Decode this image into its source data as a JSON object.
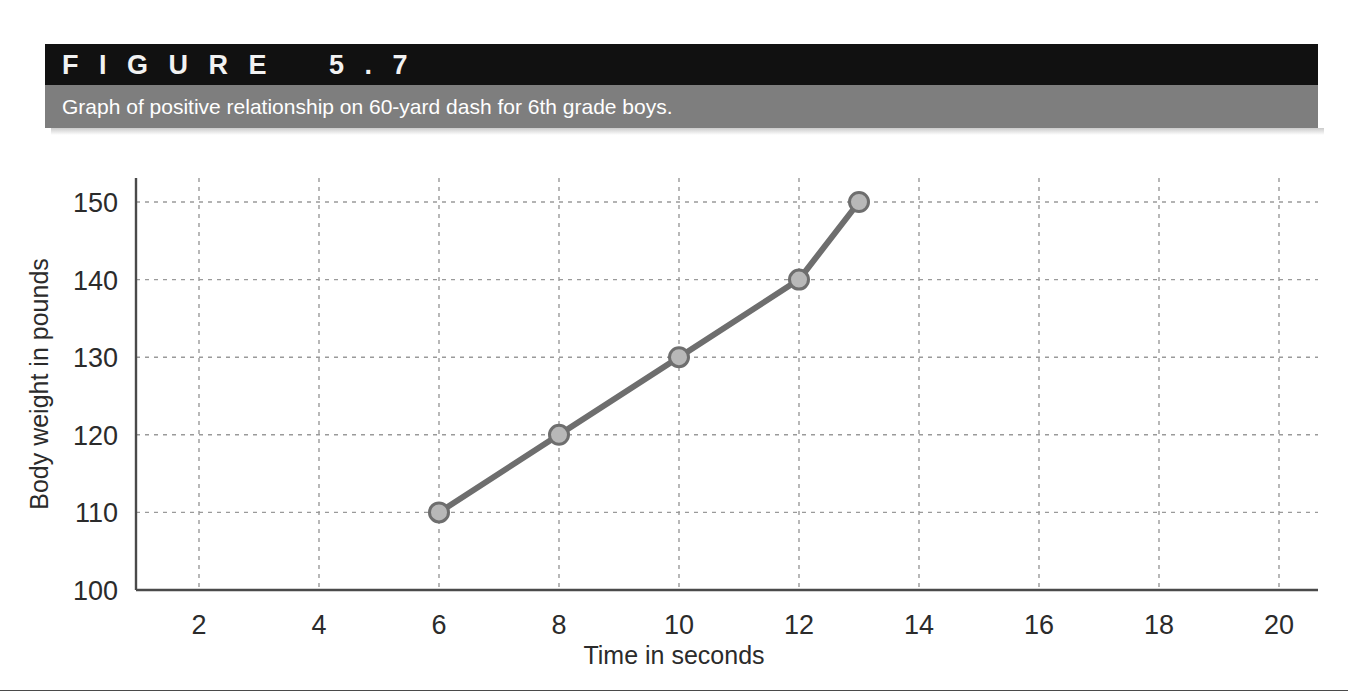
{
  "figure": {
    "number_label": "F I G U R E    5 . 7",
    "caption": "Graph of positive relationship on 60-yard dash for 6th grade boys.",
    "banner_dark_color": "#111111",
    "banner_gray_color": "#7e7e7e"
  },
  "chart_data": {
    "type": "line",
    "title": "Graph of positive relationship on 60-yard dash for 6th grade boys.",
    "xlabel": "Time in seconds",
    "ylabel": "Body weight in pounds",
    "x": [
      6,
      8,
      10,
      12,
      13
    ],
    "values": [
      110,
      120,
      130,
      140,
      150
    ],
    "points": [
      {
        "x": 6,
        "y": 110
      },
      {
        "x": 8,
        "y": 120
      },
      {
        "x": 10,
        "y": 130
      },
      {
        "x": 12,
        "y": 140
      },
      {
        "x": 13,
        "y": 150
      }
    ],
    "xlim": [
      0,
      21
    ],
    "ylim": [
      100,
      152
    ],
    "xticks": [
      2,
      4,
      6,
      8,
      10,
      12,
      14,
      16,
      18,
      20
    ],
    "xtick_labels": [
      "2",
      "4",
      "6",
      "8",
      "10",
      "12",
      "14",
      "16",
      "18",
      "20"
    ],
    "yticks": [
      100,
      110,
      120,
      130,
      140,
      150
    ],
    "ytick_labels": [
      "100",
      "110",
      "120",
      "130",
      "140",
      "150"
    ],
    "grid": true,
    "grid_style": "dashed",
    "grid_color": "#9a9a9a",
    "legend": null,
    "series_color": "#6e6e6e",
    "marker_fill": "#b8b8b8",
    "marker_edge": "#6e6e6e",
    "axis_color": "#4a4a4a"
  }
}
